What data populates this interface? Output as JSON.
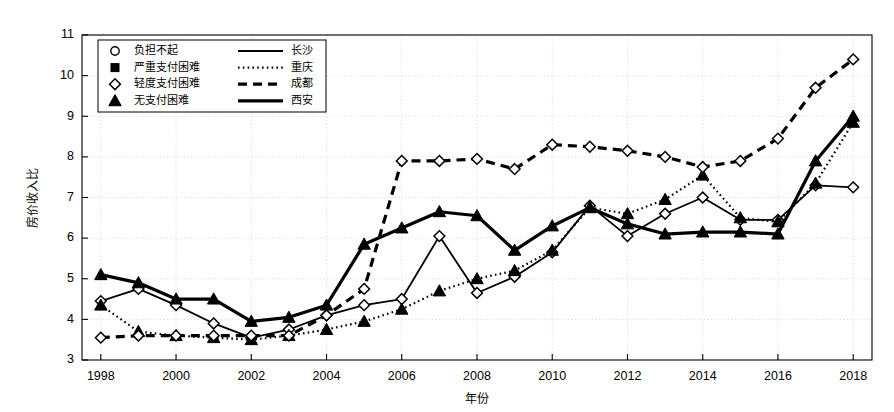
{
  "chart_data": {
    "type": "line",
    "title": "",
    "xlabel": "年份",
    "ylabel": "房价收入比",
    "xlim": [
      1997.5,
      2018.5
    ],
    "ylim": [
      3,
      11
    ],
    "yticks": [
      3,
      4,
      5,
      6,
      7,
      8,
      9,
      10,
      11
    ],
    "xticks": [
      1998,
      2000,
      2002,
      2004,
      2006,
      2008,
      2010,
      2012,
      2014,
      2016,
      2018
    ],
    "grid": true,
    "legend_position": "top-left",
    "x": [
      1998,
      1999,
      2000,
      2001,
      2002,
      2003,
      2004,
      2005,
      2006,
      2007,
      2008,
      2009,
      2010,
      2011,
      2012,
      2013,
      2014,
      2015,
      2016,
      2017,
      2018
    ],
    "series": [
      {
        "name": "长沙",
        "marker": "diamond-open",
        "linestyle": "solid",
        "values": [
          4.45,
          4.75,
          4.35,
          3.9,
          3.55,
          3.75,
          4.1,
          4.35,
          4.5,
          6.05,
          4.65,
          5.05,
          5.65,
          6.8,
          6.05,
          6.6,
          7.0,
          6.45,
          6.45,
          7.3,
          7.25
        ]
      },
      {
        "name": "重庆",
        "marker": "triangle-filled",
        "linestyle": "dotted",
        "values": [
          4.35,
          3.7,
          3.6,
          3.55,
          3.5,
          3.6,
          3.75,
          3.95,
          4.25,
          4.7,
          5.0,
          5.2,
          5.7,
          6.75,
          6.6,
          6.95,
          7.55,
          6.5,
          6.4,
          7.35,
          8.85
        ]
      },
      {
        "name": "成都",
        "marker": "diamond-open",
        "linestyle": "dashed",
        "values": [
          3.55,
          3.6,
          3.6,
          3.6,
          3.6,
          3.6,
          4.1,
          4.75,
          7.9,
          7.9,
          7.95,
          7.7,
          8.3,
          8.25,
          8.15,
          8.0,
          7.75,
          7.9,
          8.45,
          9.7,
          10.4
        ]
      },
      {
        "name": "西安",
        "marker": "triangle-filled",
        "linestyle": "solid-thick",
        "values": [
          5.1,
          4.9,
          4.5,
          4.5,
          3.95,
          4.05,
          4.35,
          5.85,
          6.25,
          6.65,
          6.55,
          5.7,
          6.3,
          6.75,
          6.35,
          6.1,
          6.15,
          6.15,
          6.1,
          7.9,
          9.0
        ]
      }
    ],
    "legend": [
      {
        "marker": "circle-open",
        "label": "负担不起",
        "line_label": "长沙",
        "line_style": "solid"
      },
      {
        "marker": "square-filled",
        "label": "严重支付困难",
        "line_label": "重庆",
        "line_style": "dotted"
      },
      {
        "marker": "diamond-open",
        "label": "轻度支付困难",
        "line_label": "成都",
        "line_style": "dashed"
      },
      {
        "marker": "triangle-filled",
        "label": "无支付困难",
        "line_label": "西安",
        "line_style": "solid-thick"
      }
    ],
    "colors": {
      "series": "#000000",
      "grid": "#cccccc",
      "axis": "#000000",
      "background": "#ffffff"
    }
  }
}
